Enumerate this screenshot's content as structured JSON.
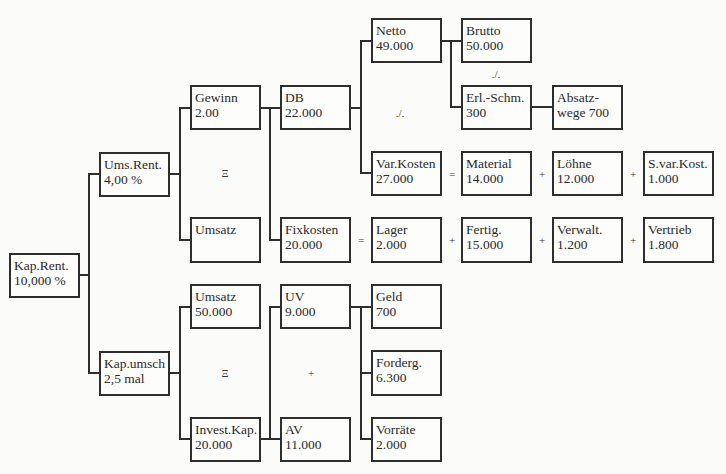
{
  "diagram": {
    "nodes": {
      "kap_rent": {
        "label": "Kap.Rent.",
        "value": "10,000 %"
      },
      "ums_rent": {
        "label": "Ums.Rent.",
        "value": "4,00 %"
      },
      "kap_umsch": {
        "label": "Kap.umsch",
        "value": "2,5 mal"
      },
      "gewinn": {
        "label": "Gewinn",
        "value": "2.00"
      },
      "umsatz_top": {
        "label": "Umsatz",
        "value": ""
      },
      "umsatz_bottom": {
        "label": "Umsatz",
        "value": "50.000"
      },
      "invest_kap": {
        "label": "Invest.Kap.",
        "value": "20.000"
      },
      "db": {
        "label": "DB",
        "value": "22.000"
      },
      "fixkosten": {
        "label": "Fixkosten",
        "value": "20.000"
      },
      "uv": {
        "label": "UV",
        "value": "9.000"
      },
      "av": {
        "label": "AV",
        "value": "11.000"
      },
      "netto": {
        "label": "Netto",
        "value": "49.000"
      },
      "var_kosten": {
        "label": "Var.Kosten",
        "value": "27.000"
      },
      "lager": {
        "label": "Lager",
        "value": "2.000"
      },
      "geld": {
        "label": "Geld",
        "value": "700"
      },
      "forderg": {
        "label": "Forderg.",
        "value": "6.300"
      },
      "vorraete": {
        "label": "Vorräte",
        "value": "2.000"
      },
      "brutto": {
        "label": "Brutto",
        "value": "50.000"
      },
      "erl_schm": {
        "label": "Erl.-Schm.",
        "value": "300"
      },
      "material": {
        "label": "Material",
        "value": "14.000"
      },
      "fertig": {
        "label": "Fertig.",
        "value": "15.000"
      },
      "absatzwege": {
        "label": "Absatz-",
        "value": "wege 700"
      },
      "loehne": {
        "label": "Löhne",
        "value": "12.000"
      },
      "verwalt": {
        "label": "Verwalt.",
        "value": "1.200"
      },
      "s_var_kost": {
        "label": "S.var.Kost.",
        "value": "1.000"
      },
      "vertrieb": {
        "label": "Vertrieb",
        "value": "1.800"
      }
    },
    "operators": {
      "ums_rent_divide": "Ξ",
      "kap_umsch_divide": "Ξ",
      "db_minus": "./.",
      "netto_minus": "./.",
      "uv_av_plus": "+",
      "var_eq": "=",
      "var_plus_1": "+",
      "var_plus_2": "+",
      "fix_eq": "=",
      "fix_plus_1": "+",
      "fix_plus_2": "+",
      "fix_plus_3": "+"
    }
  }
}
